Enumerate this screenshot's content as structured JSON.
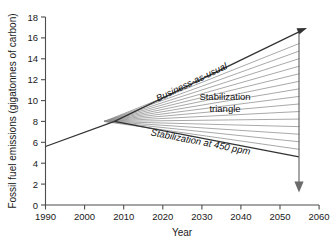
{
  "chart_data": {
    "type": "line",
    "title": "",
    "xlabel": "Year",
    "ylabel": "Fossil fuel emissions (gigatonnes of carbon)",
    "xlim": [
      1990,
      2060
    ],
    "ylim": [
      0,
      18
    ],
    "xticks": [
      1990,
      2000,
      2010,
      2020,
      2030,
      2040,
      2050,
      2060
    ],
    "yticks": [
      0,
      2,
      4,
      6,
      8,
      10,
      12,
      14,
      16,
      18
    ],
    "grid": false,
    "legend": "none",
    "series": [
      {
        "name": "Historical emissions",
        "x": [
          1990,
          2005
        ],
        "values": [
          5.6,
          8.0
        ]
      },
      {
        "name": "Business-as-usual",
        "x": [
          2005,
          2055,
          2058
        ],
        "values": [
          8.0,
          16.2,
          16.7
        ]
      },
      {
        "name": "Stabilization at 450 ppm",
        "x": [
          2005,
          2055
        ],
        "values": [
          8.0,
          4.6
        ]
      }
    ],
    "wedge": {
      "apex_x": 2005,
      "apex_y": 8.0,
      "end_x": 2055,
      "top_y": 16.2,
      "bottom_y": 4.6,
      "wedge_count": 15
    },
    "annotations": [
      {
        "text": "Business-as-usual",
        "x": 2024,
        "y": 12.1,
        "rotation": -20.5,
        "style": "italic"
      },
      {
        "text": "Stabilization",
        "x": 2035,
        "y": 10.3,
        "rotation": 0,
        "style": "normal"
      },
      {
        "text": "triangle",
        "x": 2035,
        "y": 9.3,
        "rotation": 0,
        "style": "normal"
      },
      {
        "text": "Stabilization at 450 ppm",
        "x": 2030,
        "y": 6.4,
        "rotation": 8.5,
        "style": "italic"
      }
    ],
    "vertical_marker": {
      "x": 2055,
      "y_top": 16.2,
      "y_bottom": 2.0,
      "arrow": "down"
    },
    "colors": {
      "background": "#ffffff",
      "axis": "#4d4d4d",
      "series": "#333333",
      "wedge_lines": "#8c8c8c",
      "text": "#1a1a1a"
    }
  },
  "caption_ghost": ""
}
